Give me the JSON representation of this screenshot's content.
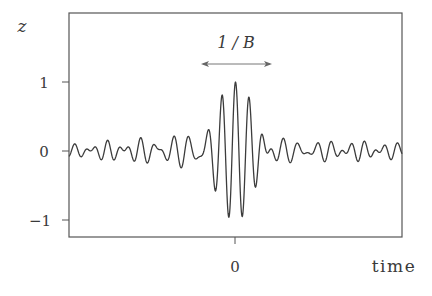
{
  "chart_data": {
    "type": "line",
    "title": "",
    "xlabel": "time",
    "ylabel": "z",
    "ylim": [
      -1.2,
      1.5
    ],
    "xlim": [
      -6.4,
      6.4
    ],
    "grid": false,
    "legend": null,
    "x_ticks": [
      {
        "value": 0,
        "label": "0"
      }
    ],
    "y_ticks": [
      {
        "value": 1,
        "label": "1"
      },
      {
        "value": 0,
        "label": "0"
      },
      {
        "value": -1,
        "label": "−1"
      }
    ],
    "annotations": [
      {
        "text": "1 / B",
        "type": "double-arrow",
        "x_start": -1.32,
        "x_end": 1.42,
        "y": 1.26,
        "description": "width of main lobe of band-limited pulse"
      }
    ],
    "series": [
      {
        "name": "z(t)",
        "description": "band-limited pulse: sinc envelope times carrier, decaying ripples on both sides",
        "key_points": [
          {
            "x": -6.4,
            "y": 0.0
          },
          {
            "x": -1.0,
            "y": 0.25
          },
          {
            "x": -0.5,
            "y": 0.78
          },
          {
            "x": -0.27,
            "y": -0.97
          },
          {
            "x": 0.0,
            "y": 1.0
          },
          {
            "x": 0.27,
            "y": -0.97
          },
          {
            "x": 0.54,
            "y": 0.78
          },
          {
            "x": 1.05,
            "y": 0.25
          },
          {
            "x": 6.4,
            "y": 0.0
          }
        ],
        "model": {
          "carrier_period": 0.52,
          "envelope": "sinc",
          "envelope_first_zero": 1.4
        }
      }
    ]
  },
  "labels": {
    "y_axis": "z",
    "x_axis": "time",
    "annotation": "1 / B",
    "y_tick_1": "1",
    "y_tick_0": "0",
    "y_tick_neg1": "−1",
    "x_tick_0": "0"
  },
  "colors": {
    "line": "#3c3c3c",
    "axes": "#555555",
    "text": "#3a3a3a",
    "arrow": "#777777"
  }
}
